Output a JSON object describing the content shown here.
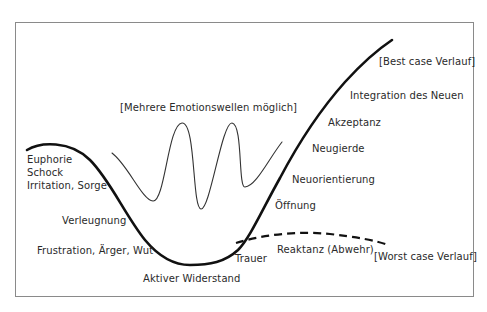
{
  "diagram": {
    "type": "change-curve",
    "waves_note": "[Mehrere Emotionswellen möglich]",
    "best_case": "[Best case Verlauf]",
    "worst_case": "[Worst case Verlauf]",
    "stages": {
      "euphorie": "Euphorie",
      "schock": "Schock",
      "irritation": "Irritation, Sorge",
      "verleugnung": "Verleugnung",
      "frustration": "Frustration, Ärger, Wut",
      "widerstand": "Aktiver Widerstand",
      "trauer": "Trauer",
      "reaktanz": "Reaktanz (Abwehr)",
      "oeffnung": "Öffnung",
      "neuorientierung": "Neuorientierung",
      "neugierde": "Neugierde",
      "akzeptanz": "Akzeptanz",
      "integration": "Integration des Neuen"
    },
    "colors": {
      "curve": "#111111",
      "waves": "#333333",
      "frame": "#8a8a8a",
      "text": "#2a2a2a"
    }
  }
}
